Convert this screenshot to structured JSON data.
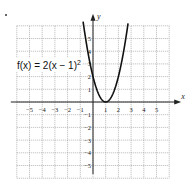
{
  "chart_data": {
    "type": "line",
    "title": "",
    "annotation": "f(x) = 2(x − 1)²",
    "function": "2*(x-1)^2",
    "xlabel": "x",
    "ylabel": "y",
    "xlim": [
      -6,
      6
    ],
    "ylim": [
      -6,
      6
    ],
    "grid": true,
    "x_ticks": [
      -5,
      -4,
      -3,
      -2,
      -1,
      1,
      2,
      3,
      4,
      5
    ],
    "y_ticks": [
      -5,
      -4,
      -3,
      -2,
      -1,
      1,
      2,
      3,
      4,
      5
    ],
    "series": [
      {
        "name": "f(x) = 2(x − 1)²",
        "x": [
          -0.75,
          -0.5,
          0,
          0.5,
          1,
          1.5,
          2,
          2.5,
          2.75
        ],
        "values": [
          6.125,
          4.5,
          2,
          0.5,
          0,
          0.5,
          2,
          4.5,
          6.125
        ]
      }
    ]
  },
  "labels": {
    "func_prefix": "f(x) = 2(x − 1)",
    "func_exp": "2",
    "x_axis": "x",
    "y_axis": "y"
  }
}
